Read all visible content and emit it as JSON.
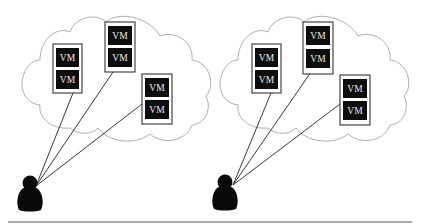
{
  "diagram": {
    "title": "",
    "vm_label": "VM",
    "colors": {
      "vm_fill": "#0d0d0d",
      "vm_text": "#e8e8e8",
      "cloud_stroke": "#9a9a9a",
      "link_stroke": "#222222",
      "baseline": "#8c8c8c"
    },
    "groups": [
      {
        "id": "left",
        "hosts": [
          {
            "id": "host-1",
            "vms": [
              "VM",
              "VM"
            ]
          },
          {
            "id": "host-2",
            "vms": [
              "VM",
              "VM"
            ]
          },
          {
            "id": "host-3",
            "vms": [
              "VM",
              "VM"
            ]
          }
        ],
        "user": "user"
      },
      {
        "id": "right",
        "hosts": [
          {
            "id": "host-1",
            "vms": [
              "VM",
              "VM"
            ]
          },
          {
            "id": "host-2",
            "vms": [
              "VM",
              "VM"
            ]
          },
          {
            "id": "host-3",
            "vms": [
              "VM",
              "VM"
            ]
          }
        ],
        "user": "user"
      }
    ]
  }
}
